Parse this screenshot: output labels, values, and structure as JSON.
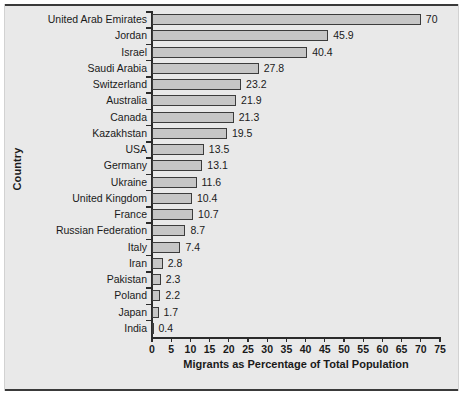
{
  "chart_data": {
    "type": "bar",
    "orientation": "horizontal",
    "title": "",
    "xlabel": "Migrants as Percentage of Total Population",
    "ylabel": "Country",
    "xlim": [
      0,
      75
    ],
    "xticks": [
      0,
      5,
      10,
      15,
      20,
      25,
      30,
      35,
      40,
      45,
      50,
      55,
      60,
      65,
      70,
      75
    ],
    "grid": false,
    "legend": null,
    "bar_fill_color": "#c6c6c6",
    "bar_edge_color": "#3c3c3c",
    "background_color": "#e9e9e9",
    "categories": [
      "United Arab Emirates",
      "Jordan",
      "Israel",
      "Saudi Arabia",
      "Switzerland",
      "Australia",
      "Canada",
      "Kazakhstan",
      "USA",
      "Germany",
      "Ukraine",
      "United Kingdom",
      "France",
      "Russian Federation",
      "Italy",
      "Iran",
      "Pakistan",
      "Poland",
      "Japan",
      "India"
    ],
    "values": [
      70,
      45.9,
      40.4,
      27.8,
      23.2,
      21.9,
      21.3,
      19.5,
      13.5,
      13.1,
      11.6,
      10.4,
      10.7,
      8.7,
      7.4,
      2.8,
      2.3,
      2.2,
      1.7,
      0.4
    ],
    "value_labels": [
      "70",
      "45.9",
      "40.4",
      "27.8",
      "23.2",
      "21.9",
      "21.3",
      "19.5",
      "13.5",
      "13.1",
      "11.6",
      "10.4",
      "10.7",
      "8.7",
      "7.4",
      "2.8",
      "2.3",
      "2.2",
      "1.7",
      "0.4"
    ]
  }
}
